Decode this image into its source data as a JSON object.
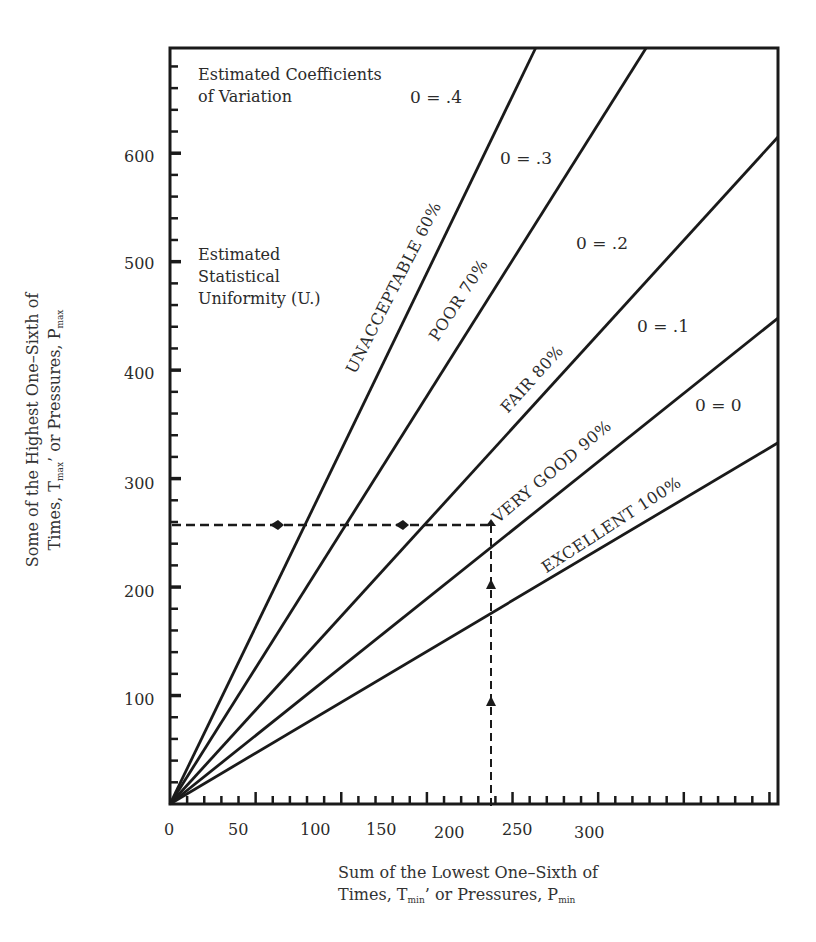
{
  "chart_data": {
    "type": "line",
    "title": "",
    "xlabel": "Sum of the Lowest One-Sixth of Times, Tmin, or Pressures, Pmin",
    "ylabel": "Some of the Highest One-Sixth of Times, Tmax, or Pressures, Pmax",
    "xlim": [
      0,
      355
    ],
    "ylim": [
      0,
      697
    ],
    "x_ticks": [
      0,
      50,
      100,
      150,
      200,
      250,
      300
    ],
    "y_ticks": [
      100,
      200,
      300,
      400,
      500,
      600
    ],
    "grid": false,
    "series": [
      {
        "name": "UNACCEPTABLE 60%",
        "cv": "0 = .4",
        "slope": 3.27,
        "points": [
          [
            0,
            0
          ],
          [
            213.5,
            697
          ]
        ]
      },
      {
        "name": "POOR 70%",
        "cv": "0 = .3",
        "slope": 2.51,
        "points": [
          [
            0,
            0
          ],
          [
            278,
            697
          ]
        ]
      },
      {
        "name": "FAIR 80%",
        "cv": "0 = .2",
        "slope": 1.73,
        "points": [
          [
            0,
            0
          ],
          [
            355,
            615
          ]
        ]
      },
      {
        "name": "VERY GOOD 90%",
        "cv": "0 = .1",
        "slope": 1.26,
        "points": [
          [
            0,
            0
          ],
          [
            355,
            448
          ]
        ]
      },
      {
        "name": "EXCELLENT 100%",
        "cv": "0 = 0",
        "slope": 0.93,
        "points": [
          [
            0,
            0
          ],
          [
            355,
            333
          ]
        ]
      }
    ],
    "example_reading": {
      "x": 190,
      "y": 260,
      "style": "dashed with arrowheads"
    },
    "annotations": [
      "Estimated Coefficients of Variation",
      "Estimated Statistical Uniformity (U.)"
    ]
  },
  "axes": {
    "x_tick_labels": [
      "0",
      "50",
      "100",
      "150",
      "200",
      "250",
      "300"
    ],
    "y_tick_labels": [
      "100",
      "200",
      "300",
      "400",
      "500",
      "600"
    ],
    "xlabel_line1": "Sum of the Lowest One–Sixth of",
    "xlabel_line2_a": "Times, T",
    "xlabel_line2_sub1": "min",
    "xlabel_line2_b": "’ or Pressures, P",
    "xlabel_line2_sub2": "min",
    "ylabel_line1": "Some of the Highest One–Sixth of",
    "ylabel_line2_a": "Times, T",
    "ylabel_line2_sub1": "max",
    "ylabel_line2_b": "’ or Pressures, P",
    "ylabel_line2_sub2": "max"
  },
  "notes": {
    "cv_title_1": "Estimated Coefficients",
    "cv_title_2": "of Variation",
    "u_title_1": "Estimated",
    "u_title_2": "Statistical",
    "u_title_3": "Uniformity (U.)"
  },
  "cv_labels": [
    "0 = .4",
    "0 = .3",
    "0 = .2",
    "0 = .1",
    "0 = 0"
  ],
  "line_labels": [
    "UNACCEPTABLE 60%",
    "POOR  70%",
    "FAIR  80%",
    "VERY GOOD  90%",
    "EXCELLENT  100%"
  ]
}
